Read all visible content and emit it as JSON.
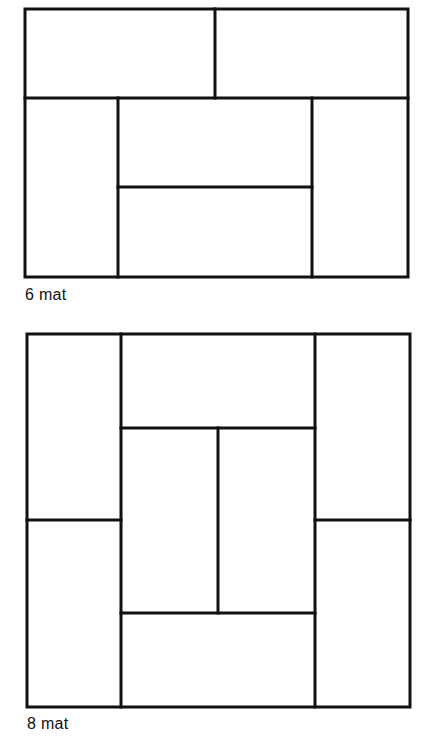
{
  "diagrams": [
    {
      "id": "six-mat",
      "label": "6 mat",
      "stroke_color": "#111111",
      "stroke_width": 3,
      "outer": {
        "x1": 25,
        "y1": 9,
        "x2": 408,
        "y2": 277
      },
      "lines": [
        {
          "x1": 25,
          "y1": 98,
          "x2": 408,
          "y2": 98
        },
        {
          "x1": 215,
          "y1": 9,
          "x2": 215,
          "y2": 98
        },
        {
          "x1": 118,
          "y1": 98,
          "x2": 118,
          "y2": 277
        },
        {
          "x1": 312,
          "y1": 98,
          "x2": 312,
          "y2": 277
        },
        {
          "x1": 118,
          "y1": 187,
          "x2": 312,
          "y2": 187
        }
      ]
    },
    {
      "id": "eight-mat",
      "label": "8 mat",
      "stroke_color": "#111111",
      "stroke_width": 3,
      "outer": {
        "x1": 27,
        "y1": 334,
        "x2": 410,
        "y2": 707
      },
      "lines": [
        {
          "x1": 121,
          "y1": 334,
          "x2": 121,
          "y2": 707
        },
        {
          "x1": 315,
          "y1": 334,
          "x2": 315,
          "y2": 707
        },
        {
          "x1": 27,
          "y1": 520,
          "x2": 121,
          "y2": 520
        },
        {
          "x1": 315,
          "y1": 520,
          "x2": 410,
          "y2": 520
        },
        {
          "x1": 121,
          "y1": 428,
          "x2": 315,
          "y2": 428
        },
        {
          "x1": 121,
          "y1": 613,
          "x2": 315,
          "y2": 613
        },
        {
          "x1": 218,
          "y1": 428,
          "x2": 218,
          "y2": 613
        }
      ]
    }
  ]
}
